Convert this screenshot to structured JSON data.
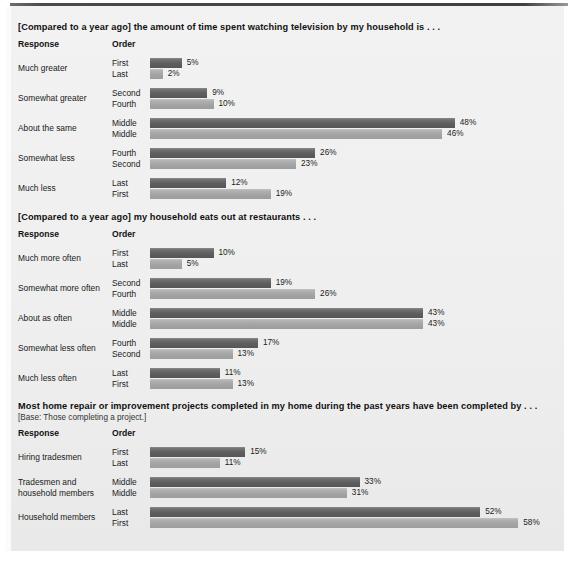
{
  "columns": {
    "response": "Response",
    "order": "Order"
  },
  "chart_data": [
    {
      "type": "bar",
      "title": "[Compared to a year ago] the amount of time spent watching television by my household is . . .",
      "base_note": "",
      "xlabel": "",
      "ylabel": "Response",
      "categories": [
        "Much greater",
        "Somewhat greater",
        "About the same",
        "Somewhat less",
        "Much less"
      ],
      "series": [
        {
          "name": "Top bar order",
          "orders": [
            "First",
            "Second",
            "Middle",
            "Fourth",
            "Last"
          ],
          "values": [
            5,
            9,
            48,
            26,
            12
          ],
          "labels": [
            "5%",
            "9%",
            "48%",
            "26%",
            "12%"
          ],
          "color": "#5e5e5e"
        },
        {
          "name": "Bottom bar order",
          "orders": [
            "Last",
            "Fourth",
            "Middle",
            "Second",
            "First"
          ],
          "values": [
            2,
            10,
            46,
            23,
            19
          ],
          "labels": [
            "2%",
            "10%",
            "46%",
            "23%",
            "19%"
          ],
          "color": "#a3a3a3"
        }
      ],
      "xlim": [
        0,
        60
      ],
      "grid": false,
      "legend": "none"
    },
    {
      "type": "bar",
      "title": "[Compared to a year ago] my household eats out at restaurants . . .",
      "base_note": "",
      "xlabel": "",
      "ylabel": "Response",
      "categories": [
        "Much more often",
        "Somewhat more often",
        "About as often",
        "Somewhat less often",
        "Much less often"
      ],
      "series": [
        {
          "name": "Top bar order",
          "orders": [
            "First",
            "Second",
            "Middle",
            "Fourth",
            "Last"
          ],
          "values": [
            10,
            19,
            43,
            17,
            11
          ],
          "labels": [
            "10%",
            "19%",
            "43%",
            "17%",
            "11%"
          ],
          "color": "#5e5e5e"
        },
        {
          "name": "Bottom bar order",
          "orders": [
            "Last",
            "Fourth",
            "Middle",
            "Second",
            "First"
          ],
          "values": [
            5,
            26,
            43,
            13,
            13
          ],
          "labels": [
            "5%",
            "26%",
            "43%",
            "13%",
            "13%"
          ],
          "color": "#a3a3a3"
        }
      ],
      "xlim": [
        0,
        60
      ],
      "grid": false,
      "legend": "none"
    },
    {
      "type": "bar",
      "title": "Most home repair or improvement projects completed in my home during the past years have been completed by . . .",
      "base_note": "[Base: Those completing a project.]",
      "xlabel": "",
      "ylabel": "Response",
      "categories": [
        "Hiring tradesmen",
        "Tradesmen and household members",
        "Household members"
      ],
      "series": [
        {
          "name": "Top bar order",
          "orders": [
            "First",
            "Middle",
            "Last"
          ],
          "values": [
            15,
            33,
            52
          ],
          "labels": [
            "15%",
            "33%",
            "52%"
          ],
          "color": "#5e5e5e"
        },
        {
          "name": "Bottom bar order",
          "orders": [
            "Last",
            "Middle",
            "First"
          ],
          "values": [
            11,
            31,
            58
          ],
          "labels": [
            "11%",
            "31%",
            "58%"
          ],
          "color": "#a3a3a3"
        }
      ],
      "xlim": [
        0,
        60
      ],
      "grid": false,
      "legend": "none"
    }
  ],
  "sections": [
    {
      "title_key": "chart_data.0.title",
      "rows": [
        {
          "response": "Much greater",
          "response_line2": "",
          "top_order": "First",
          "bottom_order": "Last",
          "top_label": "5%",
          "bottom_label": "2%"
        },
        {
          "response": "Somewhat greater",
          "response_line2": "",
          "top_order": "Second",
          "bottom_order": "Fourth",
          "top_label": "9%",
          "bottom_label": "10%"
        },
        {
          "response": "About the same",
          "response_line2": "",
          "top_order": "Middle",
          "bottom_order": "Middle",
          "top_label": "48%",
          "bottom_label": "46%"
        },
        {
          "response": "Somewhat less",
          "response_line2": "",
          "top_order": "Fourth",
          "bottom_order": "Second",
          "top_label": "26%",
          "bottom_label": "23%"
        },
        {
          "response": "Much less",
          "response_line2": "",
          "top_order": "Last",
          "bottom_order": "First",
          "top_label": "12%",
          "bottom_label": "19%"
        }
      ]
    },
    {
      "title_key": "chart_data.1.title",
      "rows": [
        {
          "response": "Much more often",
          "response_line2": "",
          "top_order": "First",
          "bottom_order": "Last",
          "top_label": "10%",
          "bottom_label": "5%"
        },
        {
          "response": "Somewhat more often",
          "response_line2": "",
          "top_order": "Second",
          "bottom_order": "Fourth",
          "top_label": "19%",
          "bottom_label": "26%"
        },
        {
          "response": "About as often",
          "response_line2": "",
          "top_order": "Middle",
          "bottom_order": "Middle",
          "top_label": "43%",
          "bottom_label": "43%"
        },
        {
          "response": "Somewhat less often",
          "response_line2": "",
          "top_order": "Fourth",
          "bottom_order": "Second",
          "top_label": "17%",
          "bottom_label": "13%"
        },
        {
          "response": "Much less often",
          "response_line2": "",
          "top_order": "Last",
          "bottom_order": "First",
          "top_label": "11%",
          "bottom_label": "13%"
        }
      ]
    },
    {
      "title_key": "chart_data.2.title",
      "rows": [
        {
          "response": "Hiring tradesmen",
          "response_line2": "",
          "top_order": "First",
          "bottom_order": "Last",
          "top_label": "15%",
          "bottom_label": "11%"
        },
        {
          "response": "Tradesmen and",
          "response_line2": "household members",
          "top_order": "Middle",
          "bottom_order": "Middle",
          "top_label": "33%",
          "bottom_label": "31%"
        },
        {
          "response": "Household members",
          "response_line2": "",
          "top_order": "Last",
          "bottom_order": "First",
          "top_label": "52%",
          "bottom_label": "58%"
        }
      ]
    }
  ]
}
